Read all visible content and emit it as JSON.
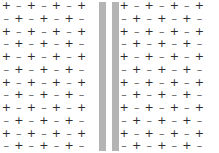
{
  "figure": {
    "width": 219,
    "height": 153,
    "background_color": "#ffffff"
  },
  "symbols": {
    "plus": "+",
    "minus": "–",
    "plus_color": "#2b2b2b",
    "minus_color": "#555555"
  },
  "plates": {
    "count": 2,
    "color": "#b4b4b4",
    "left_label": "plate-left",
    "right_label": "plate-right"
  },
  "lattice": {
    "rows": 12,
    "columns_left": 7,
    "columns_right": 7,
    "pattern": "checkerboard",
    "grid": [
      [
        "+",
        "–",
        "+",
        "–",
        "+",
        "–",
        "+",
        "",
        "+",
        "–",
        "+",
        "–",
        "+",
        "–",
        "+"
      ],
      [
        "–",
        "+",
        "–",
        "+",
        "–",
        "+",
        "–",
        "",
        "–",
        "+",
        "–",
        "+",
        "–",
        "+",
        "–"
      ],
      [
        "+",
        "–",
        "+",
        "–",
        "+",
        "–",
        "+",
        "",
        "+",
        "–",
        "+",
        "–",
        "+",
        "–",
        "+"
      ],
      [
        "–",
        "+",
        "–",
        "+",
        "–",
        "+",
        "–",
        "",
        "–",
        "+",
        "–",
        "+",
        "–",
        "+",
        "–"
      ],
      [
        "+",
        "–",
        "+",
        "–",
        "+",
        "–",
        "+",
        "",
        "+",
        "–",
        "+",
        "–",
        "+",
        "–",
        "+"
      ],
      [
        "–",
        "+",
        "–",
        "+",
        "–",
        "+",
        "–",
        "",
        "–",
        "+",
        "–",
        "+",
        "–",
        "+",
        "–"
      ],
      [
        "+",
        "–",
        "+",
        "–",
        "+",
        "–",
        "+",
        "",
        "+",
        "–",
        "+",
        "–",
        "+",
        "–",
        "+"
      ],
      [
        "–",
        "+",
        "–",
        "+",
        "–",
        "+",
        "–",
        "",
        "–",
        "+",
        "–",
        "+",
        "–",
        "+",
        "–"
      ],
      [
        "+",
        "–",
        "+",
        "–",
        "+",
        "–",
        "+",
        "",
        "+",
        "–",
        "+",
        "–",
        "+",
        "–",
        "+"
      ],
      [
        "–",
        "+",
        "–",
        "+",
        "–",
        "+",
        "–",
        "",
        "–",
        "+",
        "–",
        "+",
        "–",
        "+",
        "–"
      ],
      [
        "+",
        "–",
        "+",
        "–",
        "+",
        "–",
        "+",
        "",
        "+",
        "–",
        "+",
        "–",
        "+",
        "–",
        "+"
      ],
      [
        "–",
        "+",
        "–",
        "+",
        "–",
        "+",
        "–",
        "",
        "–",
        "+",
        "–",
        "+",
        "–",
        "+",
        "–"
      ]
    ]
  }
}
